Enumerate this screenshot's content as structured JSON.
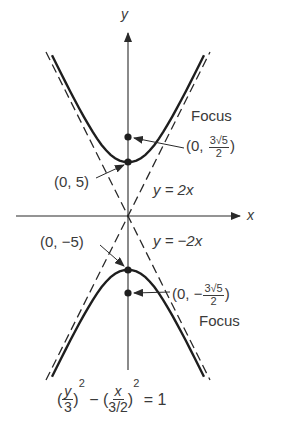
{
  "diagram": {
    "axes": {
      "x_label": "x",
      "y_label": "y"
    },
    "asymptotes": [
      {
        "label": "y = 2x",
        "slope": 2
      },
      {
        "label": "y = −2x",
        "slope": -2
      }
    ],
    "vertices": [
      {
        "label": "(0, 5)",
        "x": 0,
        "y": 3
      },
      {
        "label": "(0, −5)",
        "x": 0,
        "y": -3
      }
    ],
    "foci": [
      {
        "label_prefix": "(0, ",
        "label_num": "3√5",
        "label_den": "2",
        "label_suffix": ")",
        "caption": "Focus"
      },
      {
        "label_prefix": "(0, −",
        "label_num": "3√5",
        "label_den": "2",
        "label_suffix": ")",
        "caption": "Focus"
      }
    ],
    "equation": {
      "lparen1": "(",
      "num1": "y",
      "den1": "3",
      "rparen1": ")",
      "exp1": "2",
      "minus": "−",
      "lparen2": "(",
      "num2": "x",
      "den2": "3/2",
      "rparen2": ")",
      "exp2": "2",
      "equals": "= 1"
    },
    "colors": {
      "ink": "#2a2a2a",
      "text": "#3a3a3a",
      "background": "#ffffff"
    }
  }
}
